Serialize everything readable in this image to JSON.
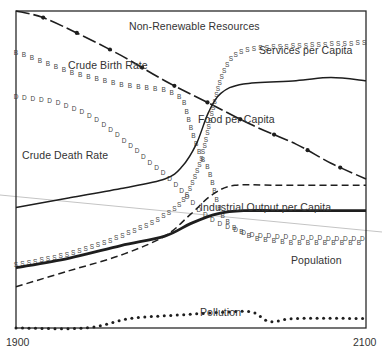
{
  "chart_data": {
    "type": "line",
    "title": "",
    "xlabel": "",
    "ylabel": "",
    "x_range": [
      1900,
      2100
    ],
    "x_tick_labels": [
      "1900",
      "2100"
    ],
    "grid": false,
    "legend": "inline labels",
    "series": [
      {
        "name": "Non-Renewable Resources",
        "style": "dash-dot with solid dots",
        "points": [
          [
            1900,
            1.0
          ],
          [
            1915,
            0.98
          ],
          [
            1935,
            0.93
          ],
          [
            1960,
            0.86
          ],
          [
            1985,
            0.78
          ],
          [
            2010,
            0.71
          ],
          [
            2035,
            0.64
          ],
          [
            2060,
            0.58
          ],
          [
            2080,
            0.52
          ],
          [
            2100,
            0.47
          ]
        ]
      },
      {
        "name": "Crude Birth Rate",
        "style": "B markers",
        "points": [
          [
            1900,
            0.87
          ],
          [
            1915,
            0.84
          ],
          [
            1930,
            0.81
          ],
          [
            1950,
            0.78
          ],
          [
            1970,
            0.76
          ],
          [
            1985,
            0.75
          ],
          [
            1995,
            0.72
          ],
          [
            2000,
            0.63
          ],
          [
            2005,
            0.55
          ],
          [
            2010,
            0.5
          ],
          [
            2015,
            0.4
          ],
          [
            2020,
            0.34
          ],
          [
            2030,
            0.3
          ],
          [
            2040,
            0.28
          ],
          [
            2060,
            0.27
          ],
          [
            2100,
            0.27
          ]
        ]
      },
      {
        "name": "Crude Death Rate",
        "style": "D markers",
        "points": [
          [
            1900,
            0.73
          ],
          [
            1915,
            0.72
          ],
          [
            1930,
            0.7
          ],
          [
            1945,
            0.66
          ],
          [
            1960,
            0.6
          ],
          [
            1975,
            0.53
          ],
          [
            1990,
            0.46
          ],
          [
            2000,
            0.4
          ],
          [
            2010,
            0.35
          ],
          [
            2025,
            0.31
          ],
          [
            2045,
            0.29
          ],
          [
            2100,
            0.28
          ]
        ]
      },
      {
        "name": "Services per Capita",
        "style": "S markers",
        "points": [
          [
            1900,
            0.2
          ],
          [
            1920,
            0.22
          ],
          [
            1940,
            0.25
          ],
          [
            1960,
            0.29
          ],
          [
            1980,
            0.34
          ],
          [
            1995,
            0.4
          ],
          [
            2005,
            0.52
          ],
          [
            2012,
            0.68
          ],
          [
            2018,
            0.8
          ],
          [
            2025,
            0.86
          ],
          [
            2035,
            0.88
          ],
          [
            2060,
            0.89
          ],
          [
            2100,
            0.9
          ]
        ]
      },
      {
        "name": "Food per Capita",
        "style": "thin solid",
        "points": [
          [
            1900,
            0.38
          ],
          [
            1930,
            0.41
          ],
          [
            1960,
            0.44
          ],
          [
            1985,
            0.47
          ],
          [
            1995,
            0.51
          ],
          [
            2003,
            0.58
          ],
          [
            2010,
            0.68
          ],
          [
            2017,
            0.74
          ],
          [
            2030,
            0.77
          ],
          [
            2060,
            0.78
          ],
          [
            2080,
            0.79
          ],
          [
            2100,
            0.78
          ]
        ]
      },
      {
        "name": "Industrial Output per Capita",
        "style": "dashed",
        "points": [
          [
            1900,
            0.13
          ],
          [
            1930,
            0.18
          ],
          [
            1960,
            0.23
          ],
          [
            1985,
            0.29
          ],
          [
            2000,
            0.36
          ],
          [
            2012,
            0.42
          ],
          [
            2025,
            0.45
          ],
          [
            2050,
            0.45
          ],
          [
            2100,
            0.45
          ]
        ]
      },
      {
        "name": "Population",
        "style": "thick solid",
        "points": [
          [
            1900,
            0.19
          ],
          [
            1930,
            0.22
          ],
          [
            1960,
            0.26
          ],
          [
            1985,
            0.29
          ],
          [
            2000,
            0.33
          ],
          [
            2015,
            0.36
          ],
          [
            2030,
            0.37
          ],
          [
            2060,
            0.37
          ],
          [
            2100,
            0.37
          ]
        ]
      },
      {
        "name": "Pollution",
        "style": "dotted",
        "points": [
          [
            1900,
            0.0
          ],
          [
            1940,
            0.0
          ],
          [
            1965,
            0.03
          ],
          [
            1990,
            0.04
          ],
          [
            2020,
            0.05
          ],
          [
            2035,
            0.05
          ],
          [
            2045,
            0.02
          ],
          [
            2060,
            0.03
          ],
          [
            2100,
            0.03
          ]
        ]
      }
    ]
  },
  "labels": {
    "non_renewable": "Non-Renewable Resources",
    "services": "Services per Capita",
    "birth_rate": "Crude Birth Rate",
    "food": "Food per Capita",
    "death_rate": "Crude Death Rate",
    "industrial": "Industrial Output per Capita",
    "population": "Population",
    "pollution": "Pollution"
  },
  "axis": {
    "x_start": "1900",
    "x_end": "2100"
  },
  "colors": {
    "ink": "#1e1e1e",
    "frame": "#2a2a2a",
    "stray_line": "#bdbdbd",
    "background": "#ffffff"
  }
}
